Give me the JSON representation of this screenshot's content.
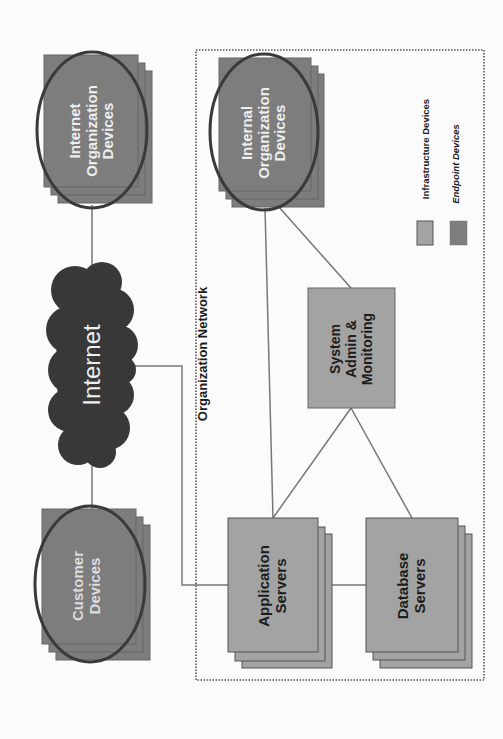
{
  "diagram": {
    "orientation": "rotated-90-ccw",
    "network_boundary": {
      "label": "Organization Network",
      "style": "dotted"
    },
    "nodes": {
      "internet_org_devices": {
        "label": "Internet\nOrganization\nDevices",
        "type": "endpoint",
        "circled": true
      },
      "internal_org_devices": {
        "label": "Internal\nOrganization\nDevices",
        "type": "endpoint",
        "circled": true
      },
      "internet": {
        "label": "Internet",
        "type": "cloud"
      },
      "customer_devices": {
        "label": "Customer\nDevices",
        "type": "endpoint",
        "circled": true
      },
      "system_admin": {
        "label": "System\nAdmin &\nMonitoring",
        "type": "infrastructure"
      },
      "application_servers": {
        "label": "Application\nServers",
        "type": "infrastructure"
      },
      "database_servers": {
        "label": "Database\nServers",
        "type": "infrastructure"
      }
    },
    "edges": [
      [
        "internet_org_devices",
        "internet"
      ],
      [
        "internet",
        "customer_devices"
      ],
      [
        "internet",
        "application_servers"
      ],
      [
        "internal_org_devices",
        "application_servers"
      ],
      [
        "internal_org_devices",
        "system_admin"
      ],
      [
        "system_admin",
        "application_servers"
      ],
      [
        "system_admin",
        "database_servers"
      ],
      [
        "application_servers",
        "database_servers"
      ]
    ],
    "legend": {
      "items": [
        {
          "label": "Infrastructure Devices",
          "color": "#a3a3a3",
          "italic": false
        },
        {
          "label": "Endpoint Devices",
          "color": "#7d7d7d",
          "italic": true
        }
      ]
    },
    "colors": {
      "infrastructure_fill": "#a3a3a3",
      "endpoint_fill": "#7d7d7d",
      "cloud_fill": "#383838",
      "ellipse_stroke": "#3a3a3a",
      "line": "#777777",
      "background": "#fbfbfb"
    }
  }
}
